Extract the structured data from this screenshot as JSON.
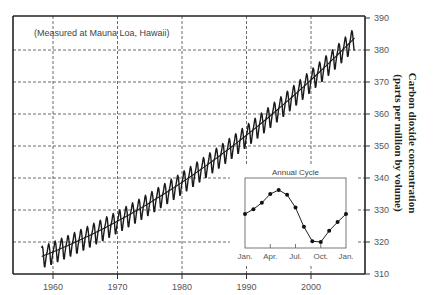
{
  "chart_data": {
    "type": "line",
    "title": "",
    "annotation": "(Measured at Mauna Loa, Hawaii)",
    "xlabel": "",
    "ylabel": "Carbon dioxide concentration (parts per million by volume)",
    "ylabel_lines": [
      "Carbon dioxide concentration",
      "(parts per million by volume)"
    ],
    "xlim": [
      1954.6,
      2008
    ],
    "ylim": [
      310,
      390
    ],
    "x_ticks": [
      1960,
      1970,
      1980,
      1990,
      2000
    ],
    "y_ticks": [
      310,
      320,
      330,
      340,
      350,
      360,
      370,
      380,
      390
    ],
    "y_axis_position": "right",
    "grid": true,
    "legend": null,
    "series": [
      {
        "name": "Monthly CO2 (seasonal)",
        "style": "zigzag",
        "start_year": 1958.25,
        "end_year": 2006.8,
        "trend_model": {
          "t0": 1958,
          "c0": 315.3,
          "c1": 0.78,
          "c2": 0.0128
        }
      },
      {
        "name": "Annual mean trend",
        "x": [
          1959,
          1960,
          1965,
          1970,
          1975,
          1980,
          1985,
          1990,
          1995,
          2000,
          2005
        ],
        "values": [
          316.5,
          317.3,
          321.9,
          327.1,
          332.9,
          339.3,
          346.4,
          354.2,
          362.5,
          371.6,
          381.2
        ]
      }
    ],
    "inset": {
      "type": "line",
      "title": "Annual Cycle",
      "x_labels": [
        "Jan.",
        "Apr.",
        "Jul.",
        "Oct.",
        "Jan."
      ],
      "months": [
        "Jan",
        "Feb",
        "Mar",
        "Apr",
        "May",
        "Jun",
        "Jul",
        "Aug",
        "Sep",
        "Oct",
        "Nov",
        "Dec",
        "Jan"
      ],
      "values": [
        0.0,
        0.6,
        1.4,
        2.5,
        3.0,
        2.4,
        0.8,
        -1.6,
        -3.4,
        -3.5,
        -2.1,
        -1.0,
        0.0
      ],
      "markers": true
    }
  },
  "colors": {
    "line": "#1a1a1a",
    "grid": "#444444",
    "frame": "#222222",
    "background": "#ffffff"
  }
}
